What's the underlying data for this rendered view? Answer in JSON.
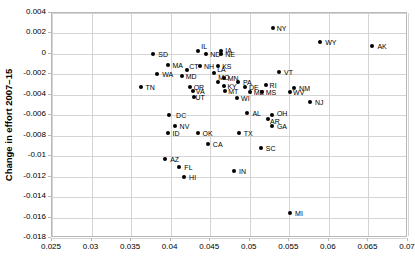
{
  "chart_data": {
    "type": "scatter",
    "title": "",
    "xlabel": "",
    "ylabel": "Change in effort 2007–15",
    "xlim": [
      0.025,
      0.07
    ],
    "ylim": [
      -0.018,
      0.004
    ],
    "xticks": [
      "0.025",
      "0.03",
      "0.035",
      "0.04",
      "0.045",
      "0.05",
      "0.055",
      "0.06",
      "0.065",
      "0.07"
    ],
    "xtick_values": [
      0.025,
      0.03,
      0.035,
      0.04,
      0.045,
      0.05,
      0.055,
      0.06,
      0.065,
      0.07
    ],
    "yticks": [
      "0.004",
      "0.002",
      "0",
      "-0.002",
      "-0.004",
      "-0.006",
      "-0.008",
      "-0.01",
      "-0.012",
      "-0.014",
      "-0.016",
      "-0.018"
    ],
    "ytick_values": [
      0.004,
      0.002,
      0,
      -0.002,
      -0.004,
      -0.006,
      -0.008,
      -0.01,
      -0.012,
      -0.014,
      -0.016,
      -0.018
    ],
    "grid": true,
    "legend": "none",
    "marker_color": "#000000",
    "grid_color": "#d4d4d4",
    "points": [
      {
        "label": "SD",
        "x": 0.0378,
        "y": 3e-05,
        "lx": 5,
        "ly": -3
      },
      {
        "label": "IL",
        "x": 0.0435,
        "y": 0.0003,
        "lx": 3,
        "ly": -8
      },
      {
        "label": "ND",
        "x": 0.0445,
        "y": 0.0,
        "lx": 4,
        "ly": -3
      },
      {
        "label": "IA",
        "x": 0.0464,
        "y": 0.00032,
        "lx": 4,
        "ly": -4
      },
      {
        "label": "NE",
        "x": 0.0464,
        "y": 3e-05,
        "lx": 4,
        "ly": -3
      },
      {
        "label": "NY",
        "x": 0.0529,
        "y": 0.00258,
        "lx": 4,
        "ly": -3
      },
      {
        "label": "WY",
        "x": 0.0589,
        "y": 0.00118,
        "lx": 5,
        "ly": -3
      },
      {
        "label": "AK",
        "x": 0.0655,
        "y": 0.00082,
        "lx": 5,
        "ly": -3
      },
      {
        "label": "MA",
        "x": 0.0396,
        "y": -0.00105,
        "lx": 5,
        "ly": -3
      },
      {
        "label": "NH",
        "x": 0.0437,
        "y": -0.00118,
        "lx": 4,
        "ly": -3
      },
      {
        "label": "KS",
        "x": 0.046,
        "y": -0.00118,
        "lx": 4,
        "ly": -3
      },
      {
        "label": "CT",
        "x": 0.0421,
        "y": -0.0016,
        "lx": 2,
        "ly": -7
      },
      {
        "label": "WA",
        "x": 0.0383,
        "y": -0.00192,
        "lx": 5,
        "ly": -3
      },
      {
        "label": "MD",
        "x": 0.0414,
        "y": -0.00215,
        "lx": 4,
        "ly": -3
      },
      {
        "label": "LA",
        "x": 0.0455,
        "y": -0.0019,
        "lx": 3,
        "ly": -7
      },
      {
        "label": "MN",
        "x": 0.0467,
        "y": -0.00232,
        "lx": 4,
        "ly": -3
      },
      {
        "label": "VT",
        "x": 0.0537,
        "y": -0.00175,
        "lx": 5,
        "ly": -3
      },
      {
        "label": "TN",
        "x": 0.0362,
        "y": -0.00325,
        "lx": 5,
        "ly": -3
      },
      {
        "label": "MO",
        "x": 0.046,
        "y": -0.0027,
        "lx": 0,
        "ly": -8
      },
      {
        "label": "PA",
        "x": 0.0485,
        "y": -0.00272,
        "lx": 5,
        "ly": -3
      },
      {
        "label": "OR",
        "x": 0.0424,
        "y": -0.00325,
        "lx": 4,
        "ly": -3
      },
      {
        "label": "KY",
        "x": 0.0468,
        "y": -0.00312,
        "lx": 3,
        "ly": -3
      },
      {
        "label": "DE",
        "x": 0.0494,
        "y": -0.0032,
        "lx": 4,
        "ly": -3
      },
      {
        "label": "RI",
        "x": 0.052,
        "y": -0.003,
        "lx": 4,
        "ly": -3
      },
      {
        "label": "NM",
        "x": 0.0556,
        "y": -0.0033,
        "lx": 5,
        "ly": -3
      },
      {
        "label": "VA",
        "x": 0.0428,
        "y": -0.00365,
        "lx": 3,
        "ly": -3
      },
      {
        "label": "MT",
        "x": 0.0469,
        "y": -0.0036,
        "lx": 3,
        "ly": -3
      },
      {
        "label": "ME",
        "x": 0.05,
        "y": -0.00368,
        "lx": 4,
        "ly": -3
      },
      {
        "label": "MS",
        "x": 0.0515,
        "y": -0.0037,
        "lx": 4,
        "ly": -3
      },
      {
        "label": "WV",
        "x": 0.0551,
        "y": -0.00375,
        "lx": 3,
        "ly": -3
      },
      {
        "label": "UT",
        "x": 0.043,
        "y": -0.00418,
        "lx": 1,
        "ly": -3
      },
      {
        "label": "WI",
        "x": 0.0484,
        "y": -0.0043,
        "lx": 4,
        "ly": -3
      },
      {
        "label": "NJ",
        "x": 0.0576,
        "y": -0.00475,
        "lx": 5,
        "ly": -3
      },
      {
        "label": "DC",
        "x": 0.0398,
        "y": -0.00595,
        "lx": 7,
        "ly": -3
      },
      {
        "label": "AL",
        "x": 0.0497,
        "y": -0.00575,
        "lx": 5,
        "ly": -3
      },
      {
        "label": "OH",
        "x": 0.0528,
        "y": -0.006,
        "lx": 5,
        "ly": -5
      },
      {
        "label": "AR",
        "x": 0.0523,
        "y": -0.0064,
        "lx": 2,
        "ly": -1
      },
      {
        "label": "NV",
        "x": 0.0405,
        "y": -0.007,
        "lx": 5,
        "ly": -3
      },
      {
        "label": "GA",
        "x": 0.0528,
        "y": -0.00705,
        "lx": 5,
        "ly": -3
      },
      {
        "label": "ID",
        "x": 0.0396,
        "y": -0.00775,
        "lx": 5,
        "ly": -3
      },
      {
        "label": "OK",
        "x": 0.0434,
        "y": -0.0077,
        "lx": 5,
        "ly": -3
      },
      {
        "label": "TX",
        "x": 0.0486,
        "y": -0.0077,
        "lx": 5,
        "ly": -3
      },
      {
        "label": "CA",
        "x": 0.0447,
        "y": -0.00885,
        "lx": 5,
        "ly": -3
      },
      {
        "label": "SC",
        "x": 0.0514,
        "y": -0.0092,
        "lx": 5,
        "ly": -3
      },
      {
        "label": "AZ",
        "x": 0.0393,
        "y": -0.01025,
        "lx": 5,
        "ly": -3
      },
      {
        "label": "FL",
        "x": 0.0411,
        "y": -0.0111,
        "lx": 5,
        "ly": -3
      },
      {
        "label": "IN",
        "x": 0.048,
        "y": -0.01145,
        "lx": 5,
        "ly": -3
      },
      {
        "label": "HI",
        "x": 0.0417,
        "y": -0.01205,
        "lx": 5,
        "ly": -3
      },
      {
        "label": "MI",
        "x": 0.0551,
        "y": -0.0156,
        "lx": 5,
        "ly": -3
      }
    ]
  }
}
